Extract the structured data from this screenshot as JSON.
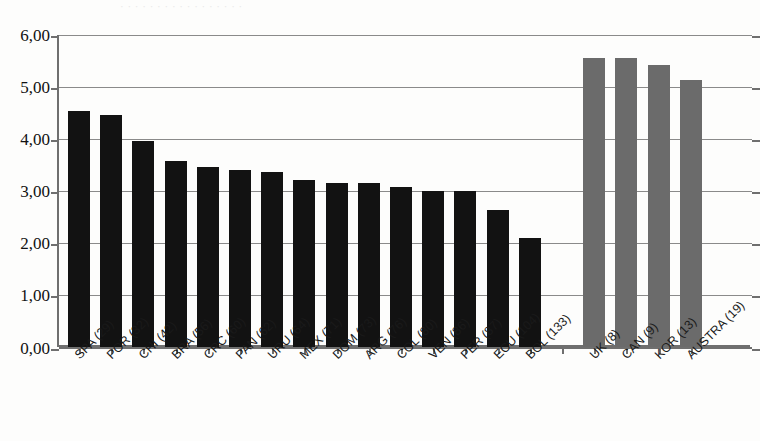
{
  "figure": {
    "top_remnant_text": "· · · · · · · · · · · · · · · · ·",
    "background_color": "#fdfdfc",
    "axis_color": "#6f6f6f",
    "grid_color": "#8a8a8a"
  },
  "chart_data": {
    "type": "bar",
    "title": "",
    "subtitle": "",
    "xlabel": "",
    "ylabel": "",
    "ylim": [
      0,
      6
    ],
    "ytick_labels": [
      "6,00",
      "5,00",
      "4,00",
      "3,00",
      "2,00",
      "1,00",
      "0,00"
    ],
    "ytick_values": [
      6,
      5,
      4,
      3,
      2,
      1,
      0
    ],
    "grid": true,
    "legend": "none",
    "decimal_separator": ",",
    "series_colors": {
      "region": "#121212",
      "reference": "#6b6b6b"
    },
    "categories": [
      "SPA (29)",
      "POR (32)",
      "CHI (42)",
      "BRA (56)",
      "CRC (60)",
      "PAN (62)",
      "URU (64)",
      "MEX (71)",
      "DOM (73)",
      "ARG (76)",
      "COL (80)",
      "VEN (86)",
      "PER (87)",
      "ECU (104)",
      "BOL (133)",
      "",
      "UK (8)",
      "CAN (9)",
      "KOR (13)",
      "AUSTRA (19)"
    ],
    "values": [
      4.54,
      4.47,
      3.97,
      3.57,
      3.46,
      3.41,
      3.36,
      3.22,
      3.15,
      3.16,
      3.07,
      3.0,
      3.0,
      2.64,
      2.1,
      null,
      5.55,
      5.55,
      5.42,
      5.13
    ],
    "groups": [
      "region",
      "region",
      "region",
      "region",
      "region",
      "region",
      "region",
      "region",
      "region",
      "region",
      "region",
      "region",
      "region",
      "region",
      "region",
      "gap",
      "reference",
      "reference",
      "reference",
      "reference"
    ]
  }
}
